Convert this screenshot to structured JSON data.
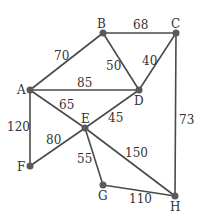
{
  "graph": {
    "type": "weighted-undirected-graph",
    "nodes": [
      {
        "id": "A",
        "label": "A",
        "x": 30,
        "y": 90
      },
      {
        "id": "B",
        "label": "B",
        "x": 103,
        "y": 33
      },
      {
        "id": "C",
        "label": "C",
        "x": 176,
        "y": 33
      },
      {
        "id": "D",
        "label": "D",
        "x": 139,
        "y": 90
      },
      {
        "id": "E",
        "label": "E",
        "x": 85,
        "y": 128
      },
      {
        "id": "F",
        "label": "F",
        "x": 30,
        "y": 166
      },
      {
        "id": "G",
        "label": "G",
        "x": 103,
        "y": 185
      },
      {
        "id": "H",
        "label": "H",
        "x": 175,
        "y": 196
      }
    ],
    "edges": [
      {
        "from": "A",
        "to": "B",
        "weight": "70"
      },
      {
        "from": "B",
        "to": "C",
        "weight": "68"
      },
      {
        "from": "B",
        "to": "D",
        "weight": "50"
      },
      {
        "from": "C",
        "to": "D",
        "weight": "40"
      },
      {
        "from": "A",
        "to": "D",
        "weight": "85"
      },
      {
        "from": "A",
        "to": "E",
        "weight": "65"
      },
      {
        "from": "A",
        "to": "F",
        "weight": "120"
      },
      {
        "from": "D",
        "to": "E",
        "weight": "45"
      },
      {
        "from": "E",
        "to": "F",
        "weight": "80"
      },
      {
        "from": "E",
        "to": "G",
        "weight": "55"
      },
      {
        "from": "E",
        "to": "H",
        "weight": "150"
      },
      {
        "from": "G",
        "to": "H",
        "weight": "110"
      },
      {
        "from": "C",
        "to": "H",
        "weight": "73"
      }
    ]
  }
}
